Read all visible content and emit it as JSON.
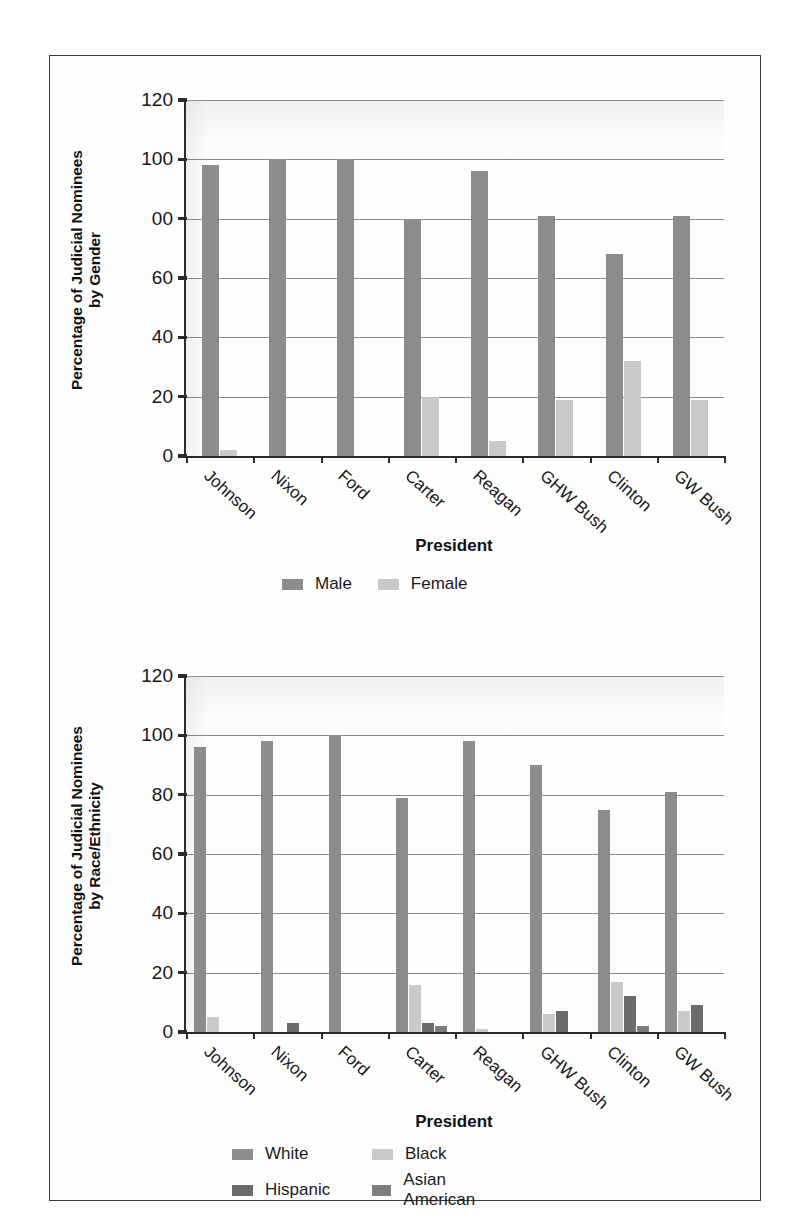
{
  "figure": {
    "panel_count": 2
  },
  "colors": {
    "male": "#8c8c8c",
    "female": "#c9c9c9",
    "white": "#8c8c8c",
    "black": "#cacaca",
    "hispanic": "#6a6a6a",
    "asian_american": "#7d7d7d",
    "axis": "#2b2b2b",
    "grid": "#888888",
    "text": "#161616",
    "frame": "#3c3c3c"
  },
  "chart_data": [
    {
      "type": "bar",
      "id": "gender",
      "title": "",
      "ylabel": "Percentage of Judicial Nominees\nby Gender",
      "xlabel": "President",
      "ylim": [
        0,
        120
      ],
      "yticks": [
        0,
        20,
        40,
        60,
        80,
        100,
        120
      ],
      "ytick_labels": [
        "0",
        "20",
        "40",
        "60",
        "00",
        "100",
        "120"
      ],
      "grid": true,
      "legend_position": "bottom",
      "categories": [
        "Johnson",
        "Nixon",
        "Ford",
        "Carter",
        "Reagan",
        "GHW Bush",
        "Clinton",
        "GW Bush"
      ],
      "series": [
        {
          "name": "Male",
          "color_key": "male",
          "values": [
            98,
            100,
            100,
            80,
            96,
            81,
            68,
            81
          ]
        },
        {
          "name": "Female",
          "color_key": "female",
          "values": [
            2,
            0,
            0,
            20,
            5,
            19,
            32,
            19
          ]
        }
      ]
    },
    {
      "type": "bar",
      "id": "race-ethnicity",
      "title": "",
      "ylabel": "Percentage of Judicial Nominees\nby Race/Ethnicity",
      "xlabel": "President",
      "ylim": [
        0,
        120
      ],
      "yticks": [
        0,
        20,
        40,
        60,
        80,
        100,
        120
      ],
      "ytick_labels": [
        "0",
        "20",
        "40",
        "60",
        "80",
        "100",
        "120"
      ],
      "grid": true,
      "legend_position": "bottom",
      "categories": [
        "Johnson",
        "Nixon",
        "Ford",
        "Carter",
        "Reagan",
        "GHW Bush",
        "Clinton",
        "GW Bush"
      ],
      "series": [
        {
          "name": "White",
          "color_key": "white",
          "values": [
            96,
            98,
            100,
            79,
            98,
            90,
            75,
            81
          ]
        },
        {
          "name": "Black",
          "color_key": "black",
          "values": [
            5,
            0,
            0,
            16,
            1,
            6,
            17,
            7
          ]
        },
        {
          "name": "Hispanic",
          "color_key": "hispanic",
          "values": [
            0,
            3,
            0,
            3,
            0,
            7,
            12,
            9
          ]
        },
        {
          "name": "Asian American",
          "color_key": "asian_american",
          "values": [
            0,
            0,
            0,
            2,
            0,
            0,
            2,
            0
          ]
        }
      ]
    }
  ]
}
